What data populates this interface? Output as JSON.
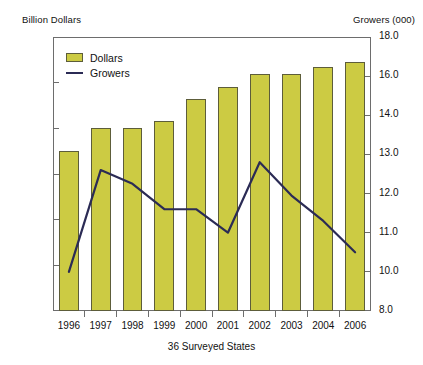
{
  "chart_data": {
    "type": "bar",
    "title": "",
    "xlabel": "36 Surveyed States",
    "ylabel": "Billion Dollars",
    "y2label": "Growers (000)",
    "categories": [
      "1996",
      "1997",
      "1998",
      "1999",
      "2000",
      "2001",
      "2002",
      "2003",
      "2004",
      "2006"
    ],
    "grid": false,
    "legend_position": "top-left",
    "ylim": [
      0.0,
      6.0
    ],
    "yticks": [
      "0.0",
      "1.0",
      "2.0",
      "3.0",
      "4.0",
      "5.0",
      "6.0"
    ],
    "y2ticks": [
      "8.0",
      "10.0",
      "11.0",
      "12.0",
      "13.0",
      "14.0",
      "16.0",
      "18.0"
    ],
    "series": [
      {
        "name": "Dollars",
        "type": "bar",
        "axis": "left",
        "color": "#cccb43",
        "values": [
          3.5,
          4.0,
          4.0,
          4.15,
          4.65,
          4.9,
          5.2,
          5.2,
          5.35,
          5.45
        ]
      },
      {
        "name": "Growers",
        "type": "line",
        "axis": "right",
        "color": "#2b2b55",
        "values": [
          10.0,
          12.6,
          12.25,
          11.6,
          11.6,
          11.0,
          12.8,
          11.95,
          11.3,
          10.5
        ]
      }
    ]
  },
  "legend": {
    "items": [
      {
        "label": "Dollars"
      },
      {
        "label": "Growers"
      }
    ]
  },
  "colors": {
    "bar_fill": "#cccb43",
    "bar_stroke": "#5d5d3a",
    "line": "#2b2b55",
    "axis": "#6d6d6d",
    "text": "#111111"
  }
}
